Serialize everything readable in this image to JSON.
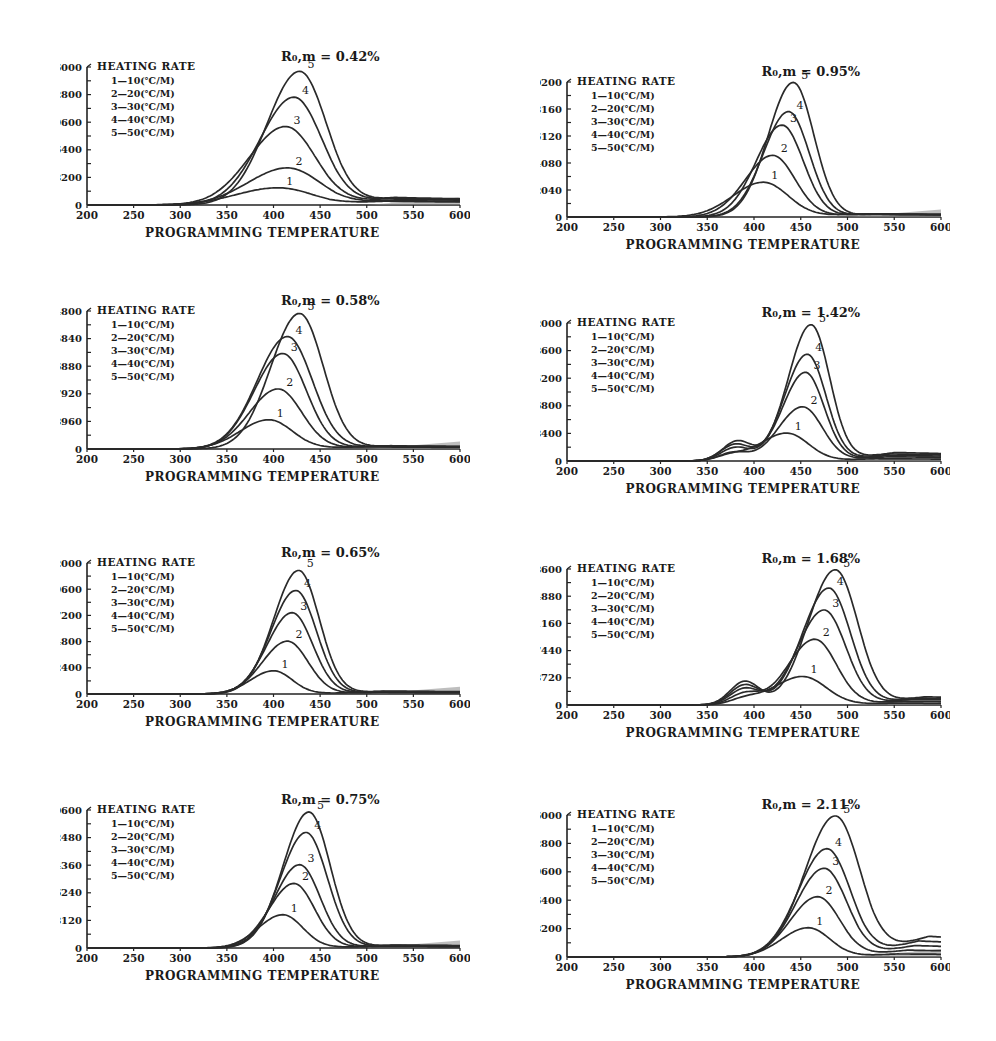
{
  "figure": {
    "layout": "4 rows x 2 columns of TPY (programmed pyrolysis) curves",
    "caption_visible": false
  },
  "shared": {
    "xlabel": "PROGRAMMING TEMPERATURE",
    "legend_title": "HEATING RATE",
    "legend_items": [
      "1—10(℃/M)",
      "2—20(℃/M)",
      "3—30(℃/M)",
      "4—40(℃/M)",
      "5—50(℃/M)"
    ],
    "x_ticks": [
      "200",
      "250",
      "300",
      "350",
      "400",
      "450",
      "500",
      "550",
      "600"
    ],
    "curve_labels": [
      "1",
      "2",
      "3",
      "4",
      "5"
    ]
  },
  "chart_data": [
    {
      "type": "line",
      "title": "R₀,m = 0.42%",
      "xlabel": "PROGRAMMING TEMPERATURE",
      "xlim": [
        200,
        600
      ],
      "ylim": [
        0,
        16000
      ],
      "y_ticks": [
        "16000",
        "12800",
        "9600",
        "6400",
        "3200",
        "0"
      ],
      "series": [
        {
          "name": "1-10(℃/M)",
          "peak_x": 405,
          "peak_y": 2000,
          "width": 55,
          "tail": 500
        },
        {
          "name": "2-20(℃/M)",
          "peak_x": 415,
          "peak_y": 4300,
          "width": 52,
          "tail": 600
        },
        {
          "name": "3-30(℃/M)",
          "peak_x": 413,
          "peak_y": 9100,
          "width": 48,
          "tail": 800
        },
        {
          "name": "4-40(℃/M)",
          "peak_x": 422,
          "peak_y": 12500,
          "width": 45,
          "tail": 900
        },
        {
          "name": "5-50(℃/M)",
          "peak_x": 428,
          "peak_y": 15500,
          "width": 43,
          "tail": 1000
        }
      ]
    },
    {
      "type": "line",
      "title": "R₀,m = 0.95%",
      "xlabel": "PROGRAMMING TEMPERATURE",
      "xlim": [
        200,
        600
      ],
      "ylim": [
        0,
        60200
      ],
      "y_ticks": [
        "60200",
        "48160",
        "36120",
        "24080",
        "12040",
        "0"
      ],
      "series": [
        {
          "name": "1-10(℃/M)",
          "peak_x": 410,
          "peak_y": 15500,
          "width": 40,
          "tail": 1500
        },
        {
          "name": "2-20(℃/M)",
          "peak_x": 420,
          "peak_y": 27500,
          "width": 36,
          "tail": 1500
        },
        {
          "name": "3-30(℃/M)",
          "peak_x": 430,
          "peak_y": 41000,
          "width": 34,
          "tail": 1500
        },
        {
          "name": "4-40(℃/M)",
          "peak_x": 437,
          "peak_y": 47000,
          "width": 33,
          "tail": 1500
        },
        {
          "name": "5-50(℃/M)",
          "peak_x": 442,
          "peak_y": 60000,
          "width": 33,
          "tail": 1500
        }
      ]
    },
    {
      "type": "line",
      "title": "R₀,m = 0.58%",
      "xlabel": "PROGRAMMING TEMPERATURE",
      "xlim": [
        200,
        600
      ],
      "ylim": [
        0,
        44800
      ],
      "y_ticks": [
        "44800",
        "35840",
        "26880",
        "17920",
        "8960",
        "0"
      ],
      "series": [
        {
          "name": "1-10(℃/M)",
          "peak_x": 395,
          "peak_y": 9500,
          "width": 38,
          "tail": 800
        },
        {
          "name": "2-20(℃/M)",
          "peak_x": 405,
          "peak_y": 19500,
          "width": 38,
          "tail": 900
        },
        {
          "name": "3-30(℃/M)",
          "peak_x": 410,
          "peak_y": 31000,
          "width": 38,
          "tail": 1000
        },
        {
          "name": "4-40(℃/M)",
          "peak_x": 415,
          "peak_y": 36500,
          "width": 40,
          "tail": 1100
        },
        {
          "name": "5-50(℃/M)",
          "peak_x": 428,
          "peak_y": 44000,
          "width": 38,
          "tail": 1200
        }
      ]
    },
    {
      "type": "line",
      "title": "R₀,m = 1.42%",
      "xlabel": "PROGRAMMING TEMPERATURE",
      "xlim": [
        200,
        600
      ],
      "ylim": [
        0,
        42000
      ],
      "y_ticks": [
        "42000",
        "33600",
        "25200",
        "16800",
        "8400",
        "0"
      ],
      "series": [
        {
          "name": "1-10(℃/M)",
          "peak_x": 435,
          "peak_y": 8500,
          "width": 35,
          "shoulder_x": 375,
          "shoulder_y": 1500,
          "tail": 800
        },
        {
          "name": "2-20(℃/M)",
          "peak_x": 452,
          "peak_y": 16500,
          "width": 32,
          "shoulder_x": 378,
          "shoulder_y": 2500,
          "tail": 1500
        },
        {
          "name": "3-30(℃/M)",
          "peak_x": 455,
          "peak_y": 27000,
          "width": 30,
          "shoulder_x": 380,
          "shoulder_y": 4000,
          "tail": 2000
        },
        {
          "name": "4-40(℃/M)",
          "peak_x": 457,
          "peak_y": 32500,
          "width": 30,
          "shoulder_x": 380,
          "shoulder_y": 5000,
          "tail": 2500
        },
        {
          "name": "5-50(℃/M)",
          "peak_x": 461,
          "peak_y": 41500,
          "width": 30,
          "shoulder_x": 382,
          "shoulder_y": 6000,
          "tail": 3000
        }
      ]
    },
    {
      "type": "line",
      "title": "R₀,m = 0.65%",
      "xlabel": "PROGRAMMING TEMPERATURE",
      "xlim": [
        200,
        600
      ],
      "ylim": [
        0,
        62000
      ],
      "y_ticks": [
        "62000",
        "49600",
        "37200",
        "24800",
        "12400",
        "0"
      ],
      "series": [
        {
          "name": "1-10(℃/M)",
          "peak_x": 400,
          "peak_y": 11000,
          "width": 30,
          "tail": 800
        },
        {
          "name": "2-20(℃/M)",
          "peak_x": 415,
          "peak_y": 25000,
          "width": 33,
          "tail": 1000
        },
        {
          "name": "3-30(℃/M)",
          "peak_x": 420,
          "peak_y": 38500,
          "width": 33,
          "tail": 1200
        },
        {
          "name": "4-40(℃/M)",
          "peak_x": 424,
          "peak_y": 49000,
          "width": 33,
          "tail": 1400
        },
        {
          "name": "5-50(℃/M)",
          "peak_x": 427,
          "peak_y": 58500,
          "width": 33,
          "tail": 1600
        }
      ]
    },
    {
      "type": "line",
      "title": "R₀,m = 1.68%",
      "xlabel": "PROGRAMMING TEMPERATURE",
      "xlim": [
        200,
        600
      ],
      "ylim": [
        0,
        18600
      ],
      "y_ticks": [
        "18600",
        "14880",
        "11160",
        "7440",
        "3720",
        "0"
      ],
      "series": [
        {
          "name": "1-10(℃/M)",
          "peak_x": 452,
          "peak_y": 3900,
          "width": 38,
          "shoulder_x": 390,
          "shoulder_y": 700,
          "tail": 300
        },
        {
          "name": "2-20(℃/M)",
          "peak_x": 465,
          "peak_y": 9000,
          "width": 35,
          "shoulder_x": 390,
          "shoulder_y": 1500,
          "tail": 600
        },
        {
          "name": "3-30(℃/M)",
          "peak_x": 475,
          "peak_y": 13000,
          "width": 35,
          "shoulder_x": 390,
          "shoulder_y": 2200,
          "tail": 900
        },
        {
          "name": "4-40(℃/M)",
          "peak_x": 480,
          "peak_y": 16000,
          "width": 35,
          "shoulder_x": 390,
          "shoulder_y": 2700,
          "tail": 1100
        },
        {
          "name": "5-50(℃/M)",
          "peak_x": 487,
          "peak_y": 18500,
          "width": 36,
          "shoulder_x": 390,
          "shoulder_y": 3200,
          "tail": 1300
        }
      ]
    },
    {
      "type": "line",
      "title": "R₀,m = 0.75%",
      "xlabel": "PROGRAMMING TEMPERATURE",
      "xlim": [
        200,
        600
      ],
      "ylim": [
        0,
        40600
      ],
      "y_ticks": [
        "40600",
        "32480",
        "24360",
        "16240",
        "8120",
        "0"
      ],
      "series": [
        {
          "name": "1-10(℃/M)",
          "peak_x": 410,
          "peak_y": 9800,
          "width": 32,
          "tail": 500
        },
        {
          "name": "2-20(℃/M)",
          "peak_x": 422,
          "peak_y": 19000,
          "width": 33,
          "tail": 700
        },
        {
          "name": "3-30(℃/M)",
          "peak_x": 428,
          "peak_y": 24500,
          "width": 33,
          "tail": 800
        },
        {
          "name": "4-40(℃/M)",
          "peak_x": 435,
          "peak_y": 34000,
          "width": 34,
          "tail": 900
        },
        {
          "name": "5-50(℃/M)",
          "peak_x": 438,
          "peak_y": 40000,
          "width": 34,
          "tail": 1000
        }
      ]
    },
    {
      "type": "line",
      "title": "R₀,m = 2.11%",
      "xlabel": "PROGRAMMING TEMPERATURE",
      "xlim": [
        200,
        600
      ],
      "ylim": [
        0,
        16000
      ],
      "y_ticks": [
        "16000",
        "12800",
        "9600",
        "6400",
        "3200",
        "0"
      ],
      "series": [
        {
          "name": "1-10(℃/M)",
          "peak_x": 458,
          "peak_y": 3300,
          "width": 35,
          "tail": 400
        },
        {
          "name": "2-20(℃/M)",
          "peak_x": 468,
          "peak_y": 6800,
          "width": 36,
          "tail": 900
        },
        {
          "name": "3-30(℃/M)",
          "peak_x": 475,
          "peak_y": 10000,
          "width": 37,
          "tail": 1500
        },
        {
          "name": "4-40(℃/M)",
          "peak_x": 478,
          "peak_y": 12200,
          "width": 38,
          "tail": 2100
        },
        {
          "name": "5-50(℃/M)",
          "peak_x": 487,
          "peak_y": 15900,
          "width": 40,
          "tail": 2700
        }
      ]
    }
  ]
}
